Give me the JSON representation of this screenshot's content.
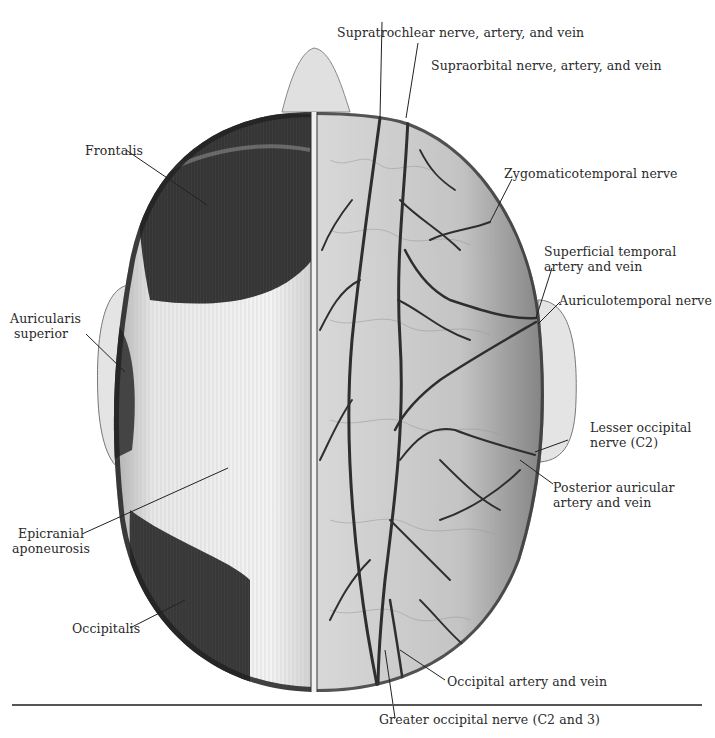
{
  "figure": {
    "colors": {
      "background": "#ffffff",
      "ink": "#2a2a2a",
      "muscle_dark": "#3a3a3a",
      "aponeurosis": "#e6e6e6",
      "skin_right": "#bdbdbd",
      "vessel": "#333333"
    }
  },
  "labels": {
    "supratrochlear": "Supratrochlear nerve, artery, and vein",
    "supraorbital": "Supraorbital nerve, artery, and vein",
    "zygomaticotemporal": "Zygomaticotemporal nerve",
    "superficial_temporal_1": "Superficial temporal",
    "superficial_temporal_2": "artery and vein",
    "auriculotemporal": "Auriculotemporal nerve",
    "lesser_occipital_1": "Lesser occipital",
    "lesser_occipital_2": "nerve (C2)",
    "posterior_auricular_1": "Posterior auricular",
    "posterior_auricular_2": "artery and vein",
    "occipital_artery": "Occipital artery and vein",
    "greater_occipital": "Greater occipital nerve (C2 and 3)",
    "frontalis": "Frontalis",
    "auricularis_1": "Auricularis",
    "auricularis_2": "superior",
    "epicranial_1": "Epicranial",
    "epicranial_2": "aponeurosis",
    "occipitalis": "Occipitalis"
  }
}
